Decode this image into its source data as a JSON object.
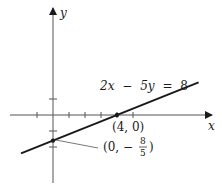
{
  "graph": {
    "axes": {
      "x_label": "x",
      "y_label": "y"
    },
    "equation": {
      "lhs_a": "2x",
      "op": "−",
      "lhs_b": "5y",
      "eq": "=",
      "rhs": "8"
    },
    "line": {
      "a": 2,
      "b": -5,
      "c": 8,
      "x_range": [
        -2,
        9.1
      ]
    },
    "x_ticks": [
      -1,
      1,
      2,
      3,
      4,
      5
    ],
    "y_ticks": [
      1,
      -1,
      -2
    ],
    "points": [
      {
        "x": 4,
        "y": 0,
        "label": "(4, 0)"
      },
      {
        "x": 0,
        "y": -1.6,
        "label_prefix": "(0, −",
        "frac_num": "8",
        "frac_den": "5",
        "label_suffix": ")"
      }
    ],
    "colors": {
      "ink": "#1a1a1a"
    }
  }
}
